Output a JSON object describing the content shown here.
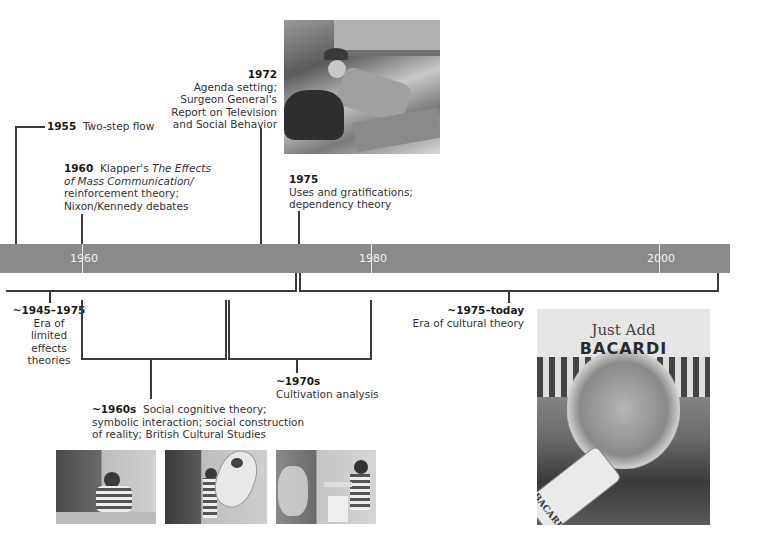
{
  "timeline": {
    "axis_ticks": [
      {
        "label": "1960",
        "x": 82
      },
      {
        "label": "1980",
        "x": 371
      },
      {
        "label": "2000",
        "x": 659
      }
    ],
    "bar_color": "#8a8a8a",
    "line_color": "#3a3a3a"
  },
  "events_above": {
    "e1955": {
      "year": "1955",
      "text": "Two-step flow"
    },
    "e1960": {
      "year": "1960",
      "text_pre": "Klapper's ",
      "title_italic_1": "The Effects",
      "title_italic_2": "of Mass Communication/",
      "line3": "reinforcement theory;",
      "line4": "Nixon/Kennedy debates"
    },
    "e1972": {
      "year": "1972",
      "lines": [
        "Agenda setting;",
        "Surgeon General's",
        "Report on Television",
        "and Social Behavior"
      ]
    },
    "e1975": {
      "year": "1975",
      "lines": [
        "Uses and gratifications;",
        "dependency theory"
      ]
    }
  },
  "eras_below": {
    "limited": {
      "range": "~1945–1975",
      "lines": [
        "Era of",
        "limited",
        "effects",
        "theories"
      ]
    },
    "cultural": {
      "range": "~1975–today",
      "text": "Era of cultural theory"
    },
    "sixties": {
      "range": "~1960s",
      "line1": "Social cognitive theory;",
      "line2": "symbolic interaction; social construction",
      "line3": "of reality; British Cultural Studies"
    },
    "seventies": {
      "range": "~1970s",
      "text": "Cultivation analysis"
    }
  },
  "images": {
    "tv_western": {
      "alt": "Black-and-white still of a cowboy falling in a western scene"
    },
    "bobo_doll": {
      "alt": "Three photos of a child hitting a Bobo doll"
    },
    "bacardi_ad": {
      "alt": "Just Add Bacardi advertisement",
      "headline_script": "Just Add",
      "headline_brand": "BACARDI",
      "bottle_label": "BACARDI"
    }
  }
}
